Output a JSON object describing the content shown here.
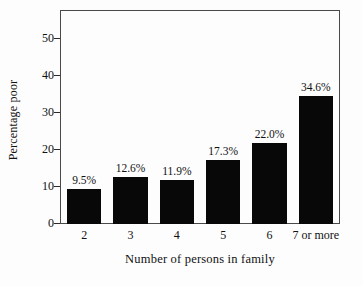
{
  "chart_data": {
    "type": "bar",
    "title": "",
    "subtitle": "",
    "xlabel": "Number of persons in family",
    "ylabel": "Percentage poor",
    "categories": [
      "2",
      "3",
      "4",
      "5",
      "6",
      "7 or more"
    ],
    "values": [
      9.5,
      12.6,
      11.9,
      17.3,
      22.0,
      34.6
    ],
    "data_labels": [
      "9.5%",
      "12.6%",
      "11.9%",
      "17.3%",
      "22.0%",
      "34.6%"
    ],
    "ylim": [
      0,
      57.5
    ],
    "y_ticks": [
      0,
      10,
      20,
      30,
      40,
      50
    ],
    "y_tick_labels": [
      "0",
      "10",
      "20",
      "30",
      "40",
      "50"
    ],
    "grid": false,
    "legend": null,
    "legend_position": "none",
    "bar_color": "#080808",
    "frame_color": "#4a4a4a",
    "background_color": "#fdfdfd",
    "text_color": "#111111"
  }
}
